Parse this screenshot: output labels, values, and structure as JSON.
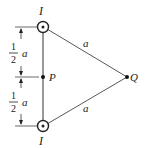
{
  "diagram": {
    "type": "physics-magnetic-field",
    "wire_top": {
      "label": "I",
      "direction": "out-of-page"
    },
    "wire_bottom": {
      "label": "I",
      "direction": "out-of-page"
    },
    "point_p": {
      "label": "P"
    },
    "point_q": {
      "label": "Q"
    },
    "side_top": {
      "label": "a"
    },
    "side_bottom": {
      "label": "a"
    },
    "dim_upper": {
      "numerator": "1",
      "denominator": "2",
      "variable": "a"
    },
    "dim_lower": {
      "numerator": "1",
      "denominator": "2",
      "variable": "a"
    },
    "colors": {
      "line": "#333333",
      "text": "#222222",
      "background": "#ffffff"
    }
  }
}
